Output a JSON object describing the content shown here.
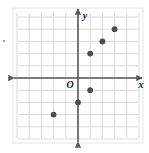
{
  "figure": {
    "name": "coordinate-plane-scatter",
    "axis_labels": {
      "x": "x",
      "y": "y",
      "origin": "O"
    },
    "colors": {
      "grid": "#d9d9d9",
      "axis": "#595959",
      "point": "#4d4d4d",
      "background": "#ffffff",
      "frame": "#e6e6e6"
    },
    "geometry": {
      "origin_px": [
        78,
        78
      ],
      "cell_px": 12.2,
      "grid_left_px": 18,
      "grid_right_px": 138,
      "grid_top_px": 13,
      "grid_bottom_px": 138
    }
  },
  "chart_data": {
    "type": "scatter",
    "title": "",
    "xlabel": "x",
    "ylabel": "y",
    "grid": true,
    "legend": "none",
    "xlim": [
      -5,
      5
    ],
    "ylim": [
      -5,
      5
    ],
    "xticks": [
      -5,
      -4,
      -3,
      -2,
      -1,
      0,
      1,
      2,
      3,
      4,
      5
    ],
    "yticks": [
      -5,
      -4,
      -3,
      -2,
      -1,
      0,
      1,
      2,
      3,
      4,
      5
    ],
    "tick_labels_shown": false,
    "points": [
      {
        "x": -2,
        "y": -3
      },
      {
        "x": 0,
        "y": -2
      },
      {
        "x": 1,
        "y": -1
      },
      {
        "x": 1,
        "y": 2
      },
      {
        "x": 2,
        "y": 3
      },
      {
        "x": 3,
        "y": 4
      }
    ]
  }
}
